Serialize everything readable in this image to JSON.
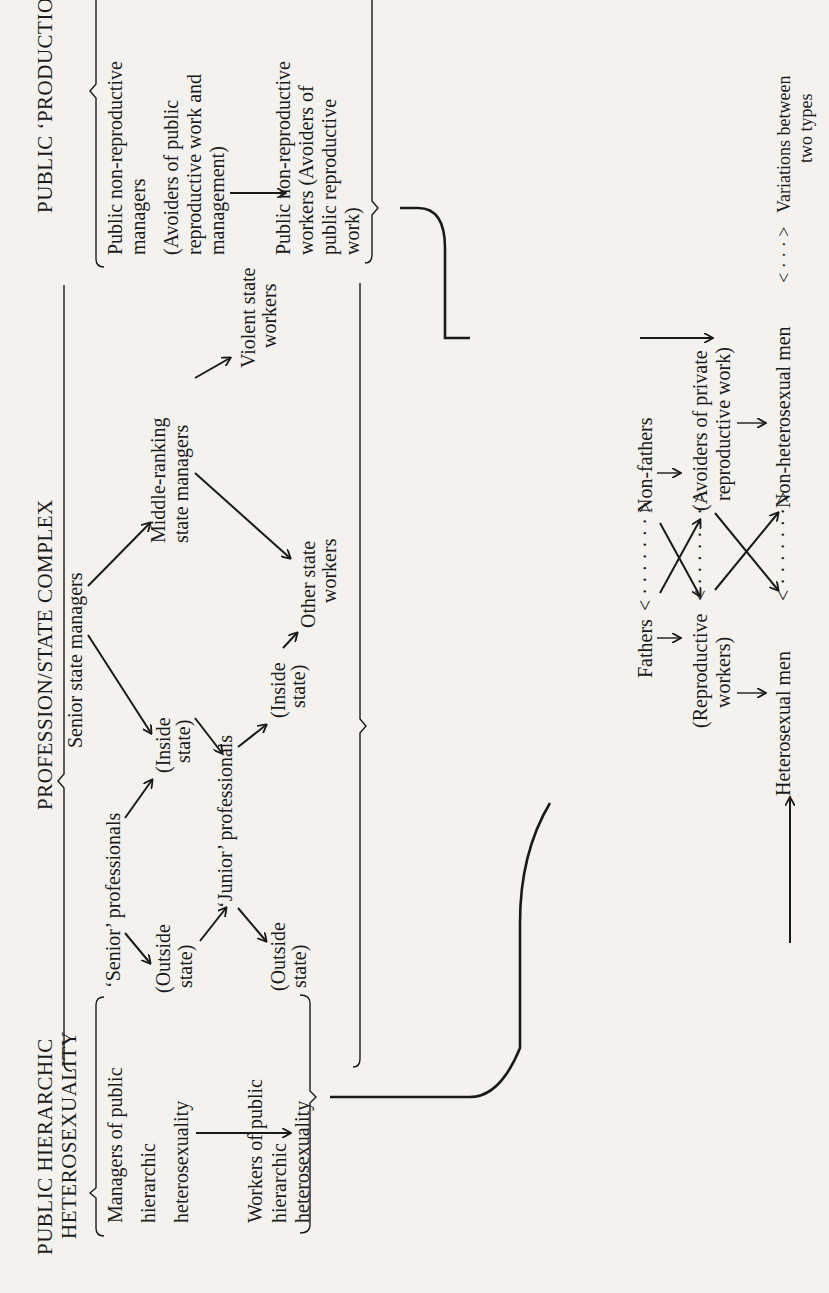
{
  "sections": {
    "hierarchic": {
      "title_line1": "PUBLIC HIERARCHIC",
      "title_line2": "HETEROSEXUALITY"
    },
    "profession": {
      "title": "PROFESSION/STATE COMPLEX"
    },
    "production": {
      "title": "PUBLIC ‘PRODUCTION’"
    }
  },
  "nodes": {
    "managers_phh": [
      "Managers of public",
      "hierarchic",
      "heterosexuality"
    ],
    "workers_phh": [
      "Workers of public",
      "hierarchic",
      "heterosexuality"
    ],
    "senior_professionals": "‘Senior’ professionals",
    "senior_outside": [
      "(Outside",
      "state)"
    ],
    "junior_professionals": "‘Junior’ professionals",
    "junior_outside": [
      "(Outside",
      "state)"
    ],
    "senior_state_managers": "Senior state managers",
    "inside_state_1": [
      "(Inside",
      "state)"
    ],
    "inside_state_2": [
      "(Inside",
      "state)"
    ],
    "middle_ranking": [
      "Middle-ranking",
      "state managers"
    ],
    "violent_workers": [
      "Violent state",
      "workers"
    ],
    "other_workers": [
      "Other state",
      "workers"
    ],
    "pnr_managers": [
      "Public non-reproductive",
      "managers"
    ],
    "pnr_managers_note": [
      "(Avoiders of public",
      "reproductive work and",
      "management)"
    ],
    "pnr_workers": [
      "Public non-reproductive",
      "workers (Avoiders of",
      "public reproductive",
      "work)"
    ],
    "fathers": "Fathers",
    "non_fathers": "Non-fathers",
    "reproductive_workers": [
      "(Reproductive",
      "workers)"
    ],
    "avoiders_private": [
      "(Avoiders of private",
      "reproductive work)"
    ],
    "heterosexual_men": "Heterosexual men",
    "non_heterosexual_men": "Non-heterosexual men",
    "dots_sep_left": "<",
    "dots_sep_right": ">",
    "dots": "· · · · · · ·"
  },
  "legend": {
    "symbol": "< · · · >",
    "line1": "Variations between",
    "line2": "two types"
  }
}
